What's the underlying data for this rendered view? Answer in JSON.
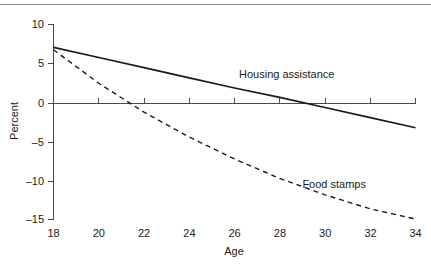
{
  "figure": {
    "background_color": "#ffffff",
    "rule_color": "#8d8d8d",
    "line_color": "#1a1a1a",
    "axis_color": "#4a4a4a"
  },
  "chart_data": {
    "type": "line",
    "title": "",
    "xlabel": "Age",
    "ylabel": "Percent",
    "xlim": [
      18,
      34
    ],
    "ylim": [
      -15,
      10
    ],
    "xticks": [
      18,
      20,
      22,
      24,
      26,
      28,
      30,
      32,
      34
    ],
    "xtick_labels": [
      "18",
      "20",
      "22",
      "24",
      "26",
      "28",
      "30",
      "32",
      "34"
    ],
    "yticks": [
      10,
      5,
      0,
      -5,
      -10,
      -15
    ],
    "ytick_labels": [
      "10",
      "5",
      "0",
      "–5",
      "–10",
      "–15"
    ],
    "grid": false,
    "legend_position": "inline-annotations",
    "zero_line": 0,
    "series": [
      {
        "name": "Housing assistance",
        "style": "solid",
        "label_x": 26.2,
        "label_y": 3.6,
        "x": [
          18,
          20,
          22,
          24,
          26,
          28,
          30,
          32,
          34
        ],
        "values": [
          7.0,
          5.7,
          4.4,
          3.1,
          1.8,
          0.6,
          -0.7,
          -2.0,
          -3.3
        ]
      },
      {
        "name": "Food stamps",
        "style": "dashed",
        "label_x": 29.0,
        "label_y": -10.5,
        "x": [
          18,
          20,
          22,
          24,
          26,
          28,
          30,
          32,
          34
        ],
        "values": [
          6.7,
          2.4,
          -1.3,
          -4.5,
          -7.3,
          -9.8,
          -11.9,
          -13.7,
          -15.0
        ]
      }
    ]
  }
}
